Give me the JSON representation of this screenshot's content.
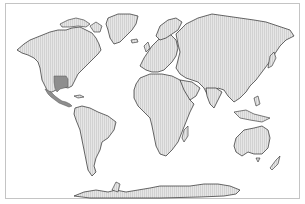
{
  "map": {
    "type": "world-choropleth",
    "projection": "equirectangular-like",
    "colors": {
      "background": "#ffffff",
      "land": "#e4e4e4",
      "land_hatch": "#cfcfcf",
      "coastline": "#2a2a2a",
      "highlight": "#8e8e8e",
      "frame": "#c4c4c4"
    },
    "highlighted_regions": [
      {
        "name": "Southern US Plains (Texas/Oklahoma region)"
      },
      {
        "name": "Mexico and Central America"
      }
    ]
  }
}
